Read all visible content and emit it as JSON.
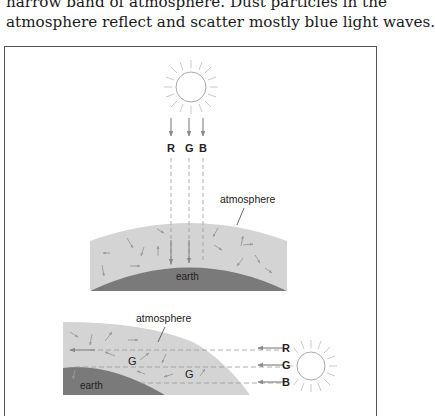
{
  "text": {
    "line1": "narrow band of atmosphere. Dust particles in the",
    "line2": "atmosphere reflect and scatter mostly blue light waves."
  },
  "diagram_top": {
    "sun_icon": "sun",
    "rays": [
      "R",
      "G",
      "B"
    ],
    "atmosphere_label": "atmosphere",
    "earth_label": "earth"
  },
  "diagram_bottom": {
    "atmosphere_label": "atmosphere",
    "earth_label": "earth",
    "scatter_labels": [
      "G",
      "G"
    ],
    "rays": [
      "R",
      "G",
      "B"
    ],
    "sun_icon": "sun"
  },
  "colors": {
    "atmosphere": "#d4d4d4",
    "earth": "#7a7a7a",
    "arrows": "#999999",
    "frame": "#555555"
  }
}
